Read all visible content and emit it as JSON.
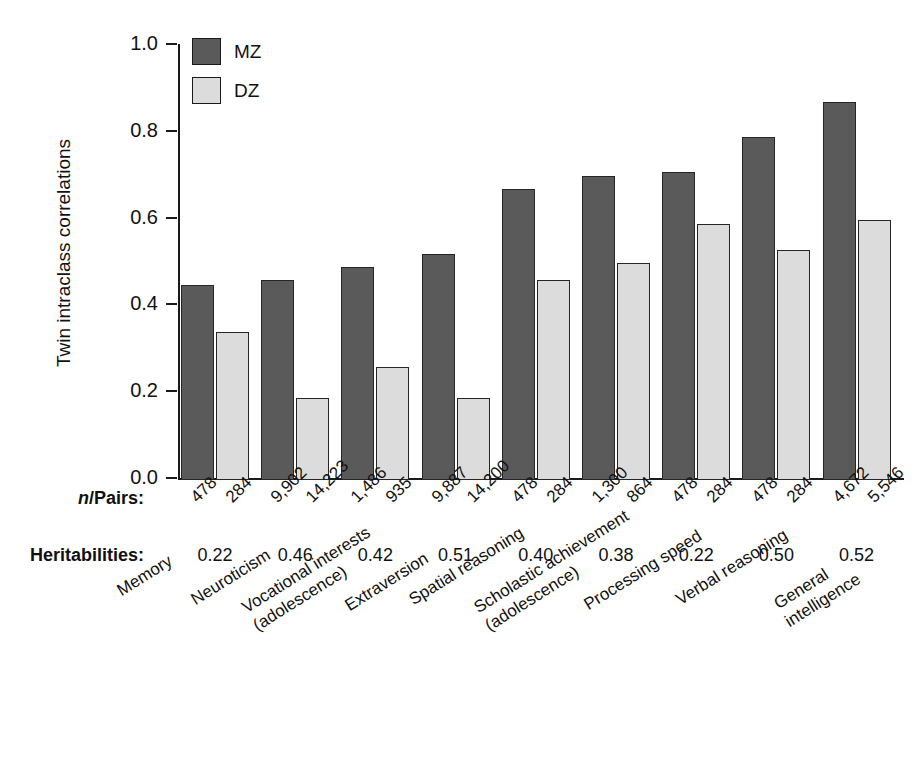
{
  "chart_data": {
    "type": "bar",
    "title": "",
    "xlabel": "",
    "ylabel": "Twin intraclass correlations",
    "ylim": [
      0.0,
      1.0
    ],
    "ytick_labels": [
      "1.0",
      "0.8",
      "0.6",
      "0.4",
      "0.2",
      "0.0"
    ],
    "ytick_values": [
      1.0,
      0.8,
      0.6,
      0.4,
      0.2,
      0.0
    ],
    "grid": false,
    "legend_position": "top-left",
    "categories": [
      "Memory",
      "Neuroticism",
      "Vocational interests (adolescence)",
      "Extraversion",
      "Spatial reasoning",
      "Scholastic achievement (adolescence)",
      "Processing speed",
      "Verbal reasoning",
      "General intelligence"
    ],
    "series": [
      {
        "name": "MZ",
        "color": "#5a5a5a",
        "values": [
          0.45,
          0.46,
          0.49,
          0.52,
          0.67,
          0.7,
          0.71,
          0.79,
          0.87
        ]
      },
      {
        "name": "DZ",
        "color": "#dcdcdc",
        "values": [
          0.34,
          0.19,
          0.26,
          0.19,
          0.46,
          0.5,
          0.59,
          0.53,
          0.6
        ]
      }
    ],
    "annotations": {
      "npairs_mz": [
        "478",
        "9,902",
        "1,486",
        "9,887",
        "478",
        "1,300",
        "478",
        "478",
        "4,672"
      ],
      "npairs_dz": [
        "284",
        "14,223",
        "935",
        "14,200",
        "284",
        "864",
        "284",
        "284",
        "5,546"
      ],
      "heritabilities": [
        "0.22",
        "0.46",
        "0.42",
        "0.51",
        "0.40",
        "0.38",
        "0.22",
        "0.50",
        "0.52"
      ]
    }
  },
  "axis": {
    "y_title": "Twin intraclass correlations",
    "y_ticks": [
      "1.0",
      "0.8",
      "0.6",
      "0.4",
      "0.2",
      "0.0"
    ]
  },
  "legend": {
    "entries": [
      {
        "label": "MZ",
        "swatch": "mz-swatch"
      },
      {
        "label": "DZ",
        "swatch": "dz-swatch"
      }
    ]
  },
  "rows": {
    "npairs_label_prefix": "n",
    "npairs_label_suffix": "/Pairs:",
    "heritabilities_label": "Heritabilities:"
  },
  "categories": [
    {
      "line1": "Memory",
      "line2": ""
    },
    {
      "line1": "Neuroticism",
      "line2": ""
    },
    {
      "line1": "Vocational interests",
      "line2": "(adolescence)"
    },
    {
      "line1": "Extraversion",
      "line2": ""
    },
    {
      "line1": "Spatial reasoning",
      "line2": ""
    },
    {
      "line1": "Scholastic achievement",
      "line2": "(adolescence)"
    },
    {
      "line1": "Processing speed",
      "line2": ""
    },
    {
      "line1": "Verbal reasoning",
      "line2": ""
    },
    {
      "line1": "General",
      "line2": "intelligence"
    }
  ]
}
